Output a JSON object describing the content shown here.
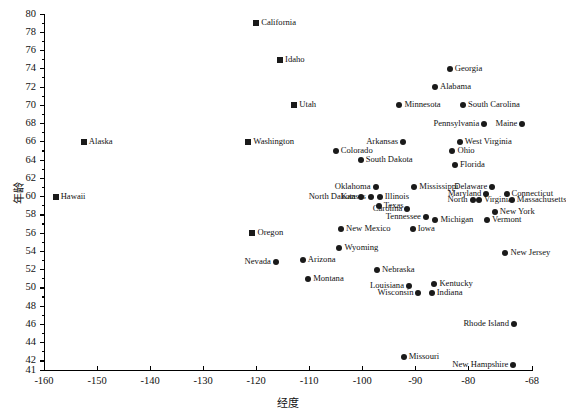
{
  "chart_data": {
    "type": "scatter",
    "title": "",
    "xlabel": "经度",
    "ylabel": "年龄",
    "xlim": [
      -160,
      -68
    ],
    "ylim": [
      41,
      80
    ],
    "grid": false,
    "legend": "none",
    "xticks": [
      "-160",
      "-150",
      "-140",
      "-130",
      "-120",
      "-110",
      "-100",
      "-90",
      "-80",
      "-68"
    ],
    "xtick_values": [
      -160,
      -150,
      -140,
      -130,
      -120,
      -110,
      -100,
      -90,
      -80,
      -68
    ],
    "yticks": [
      "41",
      "42",
      "44",
      "46",
      "48",
      "50",
      "52",
      "54",
      "56",
      "58",
      "60",
      "62",
      "64",
      "66",
      "68",
      "70",
      "72",
      "74",
      "76",
      "78",
      "80"
    ],
    "ytick_values": [
      41,
      42,
      44,
      46,
      48,
      50,
      52,
      54,
      56,
      58,
      60,
      62,
      64,
      66,
      68,
      70,
      72,
      74,
      76,
      78,
      80
    ],
    "marker_shapes": [
      "square",
      "circle"
    ],
    "point_color": "#1a1a1a",
    "points": [
      {
        "name": "California",
        "x": -120.0,
        "y": 79.0,
        "shape": "square",
        "side": "right"
      },
      {
        "name": "Idaho",
        "x": -115.5,
        "y": 75.0,
        "shape": "square",
        "side": "right"
      },
      {
        "name": "Utah",
        "x": -112.8,
        "y": 70.0,
        "shape": "square",
        "side": "right"
      },
      {
        "name": "Washington",
        "x": -121.5,
        "y": 66.0,
        "shape": "square",
        "side": "right"
      },
      {
        "name": "Oregon",
        "x": -120.7,
        "y": 56.0,
        "shape": "square",
        "side": "right"
      },
      {
        "name": "Alaska",
        "x": -152.5,
        "y": 66.0,
        "shape": "square",
        "side": "right"
      },
      {
        "name": "Hawaii",
        "x": -157.8,
        "y": 60.0,
        "shape": "square",
        "side": "right"
      },
      {
        "name": "Georgia",
        "x": -83.5,
        "y": 74.0,
        "shape": "circle",
        "side": "right"
      },
      {
        "name": "Alabama",
        "x": -86.3,
        "y": 72.0,
        "shape": "circle",
        "side": "right"
      },
      {
        "name": "Minnesota",
        "x": -93.0,
        "y": 70.0,
        "shape": "circle",
        "side": "right"
      },
      {
        "name": "South Carolina",
        "x": -81.0,
        "y": 70.0,
        "shape": "circle",
        "side": "right"
      },
      {
        "name": "Pennsylvania",
        "x": -77.0,
        "y": 68.0,
        "shape": "circle",
        "side": "left"
      },
      {
        "name": "Maine",
        "x": -69.8,
        "y": 68.0,
        "shape": "circle",
        "side": "left"
      },
      {
        "name": "Arkansas",
        "x": -92.3,
        "y": 66.0,
        "shape": "circle",
        "side": "left"
      },
      {
        "name": "West Virginia",
        "x": -81.6,
        "y": 66.0,
        "shape": "circle",
        "side": "right"
      },
      {
        "name": "Colorado",
        "x": -105.0,
        "y": 65.0,
        "shape": "circle",
        "side": "right"
      },
      {
        "name": "Ohio",
        "x": -83.0,
        "y": 65.0,
        "shape": "circle",
        "side": "right"
      },
      {
        "name": "South Dakota",
        "x": -100.3,
        "y": 64.0,
        "shape": "circle",
        "side": "right"
      },
      {
        "name": "Florida",
        "x": -82.5,
        "y": 63.5,
        "shape": "circle",
        "side": "right"
      },
      {
        "name": "Mississippi",
        "x": -90.2,
        "y": 61.0,
        "shape": "circle",
        "side": "right"
      },
      {
        "name": "Delaware",
        "x": -75.5,
        "y": 61.0,
        "shape": "circle",
        "side": "left"
      },
      {
        "name": "Oklahoma",
        "x": -97.5,
        "y": 61.0,
        "shape": "circle",
        "side": "left"
      },
      {
        "name": "Maryland",
        "x": -76.6,
        "y": 60.3,
        "shape": "circle",
        "side": "left"
      },
      {
        "name": "Connecticut",
        "x": -72.8,
        "y": 60.3,
        "shape": "circle",
        "side": "right"
      },
      {
        "name": "Kansas",
        "x": -98.4,
        "y": 60.0,
        "shape": "circle",
        "side": "left"
      },
      {
        "name": "Illinois",
        "x": -96.7,
        "y": 60.0,
        "shape": "circle",
        "side": "right"
      },
      {
        "name": "North Dakota",
        "x": -100.3,
        "y": 60.0,
        "shape": "circle",
        "side": "left"
      },
      {
        "name": "North",
        "x": -79.2,
        "y": 59.6,
        "shape": "circle",
        "side": "left"
      },
      {
        "name": "Virginia",
        "x": -78.0,
        "y": 59.6,
        "shape": "circle",
        "side": "right"
      },
      {
        "name": "Massachusetts",
        "x": -71.8,
        "y": 59.6,
        "shape": "circle",
        "side": "right"
      },
      {
        "name": "Texas",
        "x": -96.9,
        "y": 59.0,
        "shape": "circle",
        "side": "right"
      },
      {
        "name": "Carolina",
        "x": -91.5,
        "y": 58.6,
        "shape": "circle",
        "side": "left"
      },
      {
        "name": "New York",
        "x": -75.0,
        "y": 58.3,
        "shape": "circle",
        "side": "right"
      },
      {
        "name": "Tennessee",
        "x": -88.0,
        "y": 57.8,
        "shape": "circle",
        "side": "left"
      },
      {
        "name": "Michigan",
        "x": -86.2,
        "y": 57.4,
        "shape": "circle",
        "side": "right"
      },
      {
        "name": "Vermont",
        "x": -76.5,
        "y": 57.4,
        "shape": "circle",
        "side": "right"
      },
      {
        "name": "Iowa",
        "x": -90.5,
        "y": 56.4,
        "shape": "circle",
        "side": "right"
      },
      {
        "name": "New Mexico",
        "x": -104.0,
        "y": 56.4,
        "shape": "circle",
        "side": "right"
      },
      {
        "name": "Wyoming",
        "x": -104.3,
        "y": 54.4,
        "shape": "circle",
        "side": "right"
      },
      {
        "name": "New Jersey",
        "x": -73.0,
        "y": 53.8,
        "shape": "circle",
        "side": "right"
      },
      {
        "name": "Nevada",
        "x": -116.3,
        "y": 52.8,
        "shape": "circle",
        "side": "left"
      },
      {
        "name": "Arizona",
        "x": -111.2,
        "y": 53.0,
        "shape": "circle",
        "side": "right"
      },
      {
        "name": "Nebraska",
        "x": -97.2,
        "y": 52.0,
        "shape": "circle",
        "side": "right"
      },
      {
        "name": "Montana",
        "x": -110.2,
        "y": 51.0,
        "shape": "circle",
        "side": "right"
      },
      {
        "name": "Louisiana",
        "x": -91.2,
        "y": 50.2,
        "shape": "circle",
        "side": "left"
      },
      {
        "name": "Kentucky",
        "x": -86.4,
        "y": 50.4,
        "shape": "circle",
        "side": "right"
      },
      {
        "name": "Wisconsin",
        "x": -89.4,
        "y": 49.4,
        "shape": "circle",
        "side": "left"
      },
      {
        "name": "Indiana",
        "x": -86.9,
        "y": 49.4,
        "shape": "circle",
        "side": "right"
      },
      {
        "name": "Rhode Island",
        "x": -71.4,
        "y": 46.0,
        "shape": "circle",
        "side": "left"
      },
      {
        "name": "Missouri",
        "x": -92.2,
        "y": 42.4,
        "shape": "circle",
        "side": "right"
      },
      {
        "name": "New Hampshire",
        "x": -71.5,
        "y": 41.6,
        "shape": "circle",
        "side": "left"
      }
    ]
  }
}
